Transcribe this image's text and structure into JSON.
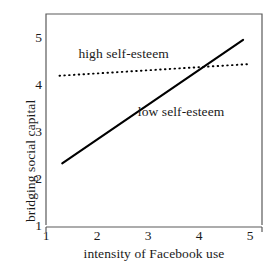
{
  "chart_data": {
    "type": "line",
    "title": "",
    "xlabel": "intensity of Facebook use",
    "ylabel": "bridging social capital",
    "xlim": [
      1,
      5
    ],
    "ylim": [
      1,
      5
    ],
    "xticks": [
      1,
      2,
      3,
      4,
      5
    ],
    "yticks": [
      1,
      2,
      3,
      4,
      5
    ],
    "xtick_labels": [
      "1",
      "2",
      "3",
      "4",
      "5"
    ],
    "ytick_labels": [
      "1",
      "2",
      "3",
      "4",
      "5"
    ],
    "grid": false,
    "legend_position": "inline-annotations",
    "series": [
      {
        "name": "high self-esteem",
        "style": "dotted",
        "color": "#000000",
        "x": [
          1.25,
          4.75
        ],
        "values": [
          3.83,
          4.05
        ]
      },
      {
        "name": "low self-esteem",
        "style": "solid",
        "color": "#000000",
        "x": [
          1.3,
          4.65
        ],
        "values": [
          2.17,
          4.51
        ]
      }
    ],
    "annotations": [
      {
        "text": "high self-esteem",
        "x": 1.6,
        "y": 4.25
      },
      {
        "text": "low self-esteem",
        "x": 2.7,
        "y": 3.15
      }
    ],
    "intersection": {
      "x": 3.9,
      "y": 4.0
    }
  },
  "axes": {
    "y_title": "bridging social capital",
    "x_title": "intensity of Facebook use",
    "y_tick_labels": [
      "5",
      "4",
      "3",
      "2",
      "1"
    ],
    "x_tick_labels": [
      "1",
      "2",
      "3",
      "4",
      "5"
    ]
  },
  "labels": {
    "high": "high self-esteem",
    "low": "low self-esteem"
  },
  "colors": {
    "background": "#ffffff",
    "axis": "#4d4d4d",
    "line": "#111111",
    "text": "#1a1a1a"
  }
}
